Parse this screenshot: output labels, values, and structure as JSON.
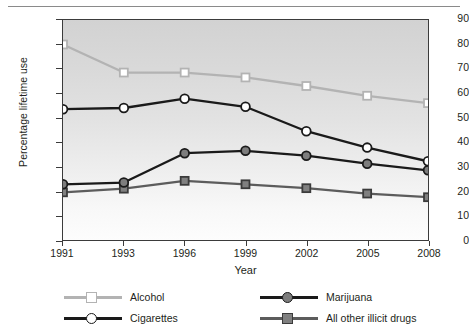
{
  "chart_data": {
    "type": "line",
    "title": "",
    "xlabel": "Year",
    "ylabel": "Percentage lifetime use",
    "categories": [
      "1991",
      "1993",
      "1996",
      "1999",
      "2002",
      "2005",
      "2008"
    ],
    "x": [
      1991,
      1993,
      1996,
      1999,
      2002,
      2005,
      2008
    ],
    "xlim": [
      1991,
      2008
    ],
    "ylim": [
      0,
      90
    ],
    "yticks": [
      0,
      10,
      20,
      30,
      40,
      50,
      60,
      70,
      80,
      90
    ],
    "ytick_labels": [
      "0",
      "10",
      "20",
      "30",
      "40",
      "50",
      "60",
      "70",
      "80",
      "90"
    ],
    "grid": false,
    "legend_position": "bottom",
    "series": [
      {
        "name": "Alcohol",
        "values": [
          80.0,
          68.5,
          68.5,
          66.5,
          63.0,
          59.0,
          56.0
        ],
        "color": "#b3b3b3",
        "marker": "square",
        "marker_fill": "#ffffff",
        "marker_edge": "#b3b3b3"
      },
      {
        "name": "Cigarettes",
        "values": [
          53.5,
          54.0,
          57.8,
          54.5,
          44.5,
          37.8,
          32.2
        ],
        "color": "#1a1a1a",
        "marker": "circle",
        "marker_fill": "#ffffff",
        "marker_edge": "#1a1a1a"
      },
      {
        "name": "Marijuana",
        "values": [
          22.8,
          23.5,
          35.5,
          36.5,
          34.5,
          31.2,
          28.5
        ],
        "color": "#1a1a1a",
        "marker": "circle",
        "marker_fill": "#7d7d7d",
        "marker_edge": "#1a1a1a"
      },
      {
        "name": "All other illicit drugs",
        "values": [
          19.5,
          21.0,
          24.2,
          22.8,
          21.2,
          19.0,
          17.5
        ],
        "color": "#5c5c5c",
        "marker": "square",
        "marker_fill": "#808080",
        "marker_edge": "#3b3b3b"
      }
    ]
  },
  "legend": {
    "items": [
      {
        "label": "Alcohol"
      },
      {
        "label": "Cigarettes"
      },
      {
        "label": "Marijuana"
      },
      {
        "label": "All other illicit drugs"
      }
    ]
  },
  "colors": {
    "axis": "#3b3b3b",
    "text": "#231f20",
    "plot_bg_top": "#d2d2d2",
    "plot_bg_bottom": "#fdfdfd",
    "page_bg": "#ffffff",
    "rule": "#8a8a8a"
  }
}
